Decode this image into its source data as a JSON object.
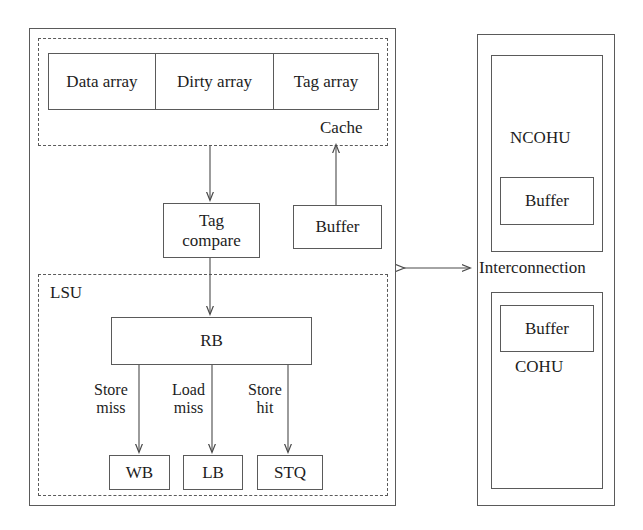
{
  "diagram": {
    "left_panel": {
      "cache_group": {
        "label": "Cache",
        "arrays": [
          {
            "label": "Data array"
          },
          {
            "label": "Dirty array"
          },
          {
            "label": "Tag array"
          }
        ]
      },
      "tag_compare": {
        "line1": "Tag",
        "line2": "compare"
      },
      "buffer": {
        "label": "Buffer"
      },
      "lsu_group": {
        "label": "LSU",
        "rb": {
          "label": "RB"
        },
        "paths": [
          {
            "edge_line1": "Store",
            "edge_line2": "miss",
            "target": "WB"
          },
          {
            "edge_line1": "Load",
            "edge_line2": "miss",
            "target": "LB"
          },
          {
            "edge_line1": "Store",
            "edge_line2": "hit",
            "target": "STQ"
          }
        ]
      }
    },
    "interconnect": {
      "label": "Interconnection",
      "arrow": "bidirectional-arrow"
    },
    "right_panel": {
      "ncohu": {
        "label": "NCOHU",
        "buffer": "Buffer"
      },
      "cohu": {
        "label": "COHU",
        "buffer": "Buffer"
      }
    }
  },
  "colors": {
    "stroke": "#5a5a5a",
    "text": "#1d1d1d",
    "background": "#ffffff"
  }
}
